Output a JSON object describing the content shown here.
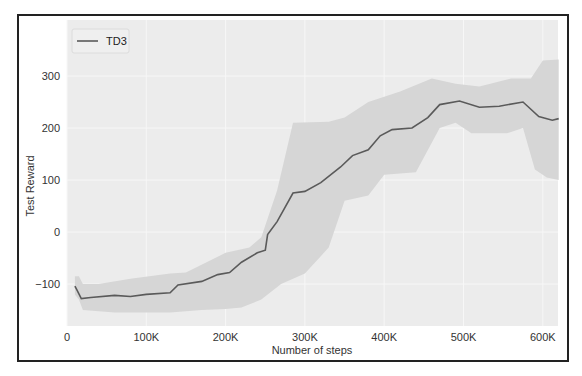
{
  "chart_data": {
    "type": "line",
    "title": "",
    "xlabel": "Number of steps",
    "ylabel": "Test Reward",
    "xlim": [
      0,
      620000
    ],
    "ylim": [
      -180,
      360
    ],
    "x_ticks": [
      0,
      100000,
      200000,
      300000,
      400000,
      500000,
      600000
    ],
    "x_tick_labels": [
      "0",
      "100K",
      "200K",
      "300K",
      "400K",
      "500K",
      "600K"
    ],
    "y_ticks": [
      -100,
      0,
      100,
      200,
      300
    ],
    "y_tick_labels": [
      "−100",
      "0",
      "100",
      "200",
      "300"
    ],
    "grid": true,
    "legend": {
      "position": "upper left",
      "entries": [
        "TD3"
      ]
    },
    "colors": {
      "line": "#5a5a5a",
      "band": "#d6d6d6",
      "plot_bg": "#ececec",
      "grid": "#f7f7f7"
    },
    "series": [
      {
        "name": "TD3",
        "x_k": [
          10,
          12,
          18,
          30,
          60,
          80,
          100,
          130,
          140,
          170,
          190,
          205,
          220,
          240,
          250,
          253,
          265,
          285,
          300,
          320,
          345,
          360,
          380,
          395,
          410,
          435,
          455,
          470,
          495,
          520,
          545,
          575,
          595,
          612,
          620
        ],
        "mean": [
          -104,
          -110,
          -128,
          -126,
          -122,
          -124,
          -120,
          -117,
          -102,
          -95,
          -82,
          -78,
          -58,
          -40,
          -35,
          -5,
          20,
          75,
          78,
          95,
          125,
          147,
          158,
          185,
          197,
          200,
          220,
          245,
          252,
          240,
          242,
          250,
          222,
          215,
          218
        ]
      }
    ],
    "band": {
      "upper_x_k": [
        10,
        15,
        20,
        40,
        80,
        130,
        150,
        200,
        230,
        245,
        265,
        285,
        330,
        350,
        380,
        420,
        460,
        490,
        520,
        560,
        585,
        600,
        620
      ],
      "upper": [
        -85,
        -85,
        -100,
        -100,
        -90,
        -80,
        -78,
        -40,
        -30,
        -10,
        80,
        210,
        212,
        220,
        250,
        270,
        295,
        285,
        280,
        295,
        295,
        330,
        332
      ],
      "lower_x_k": [
        10,
        15,
        20,
        60,
        130,
        170,
        200,
        220,
        245,
        270,
        300,
        330,
        350,
        380,
        400,
        440,
        470,
        490,
        510,
        555,
        575,
        590,
        605,
        620
      ],
      "lower": [
        -120,
        -130,
        -150,
        -155,
        -155,
        -150,
        -148,
        -145,
        -130,
        -100,
        -80,
        -30,
        60,
        70,
        110,
        115,
        200,
        210,
        190,
        190,
        200,
        120,
        105,
        100
      ]
    }
  }
}
